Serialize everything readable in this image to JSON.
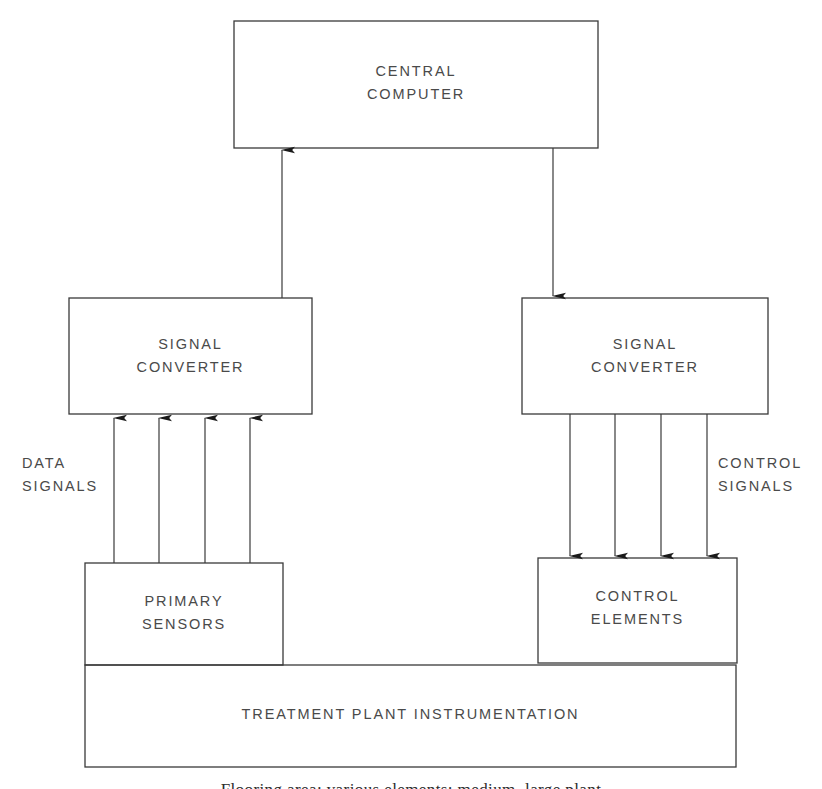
{
  "figure": {
    "type": "block-diagram",
    "background_color": "#ffffff",
    "line_color": "#333333",
    "text_color": "#4a4a4a"
  },
  "boxes": {
    "central_computer": {
      "label": "CENTRAL\nCOMPUTER",
      "x": 234,
      "y": 21,
      "width": 364,
      "height": 127
    },
    "signal_converter_left": {
      "label": "SIGNAL\nCONVERTER",
      "x": 69,
      "y": 298,
      "width": 243,
      "height": 116
    },
    "signal_converter_right": {
      "label": "SIGNAL\nCONVERTER",
      "x": 522,
      "y": 298,
      "width": 246,
      "height": 116
    },
    "primary_sensors": {
      "label": "PRIMARY\nSENSORS",
      "x": 85,
      "y": 563,
      "width": 198,
      "height": 102
    },
    "control_elements": {
      "label": "CONTROL\nELEMENTS",
      "x": 538,
      "y": 558,
      "width": 199,
      "height": 105
    },
    "treatment_plant": {
      "label": "TREATMENT PLANT INSTRUMENTATION",
      "x": 85,
      "y": 665,
      "width": 651,
      "height": 102
    }
  },
  "labels": {
    "data_signals": "DATA\nSIGNALS",
    "control_signals": "CONTROL\nSIGNALS"
  },
  "connectors": {
    "sensors_to_converter": {
      "name": "data-signal-arrows",
      "direction": "up",
      "count": 4,
      "x_positions": [
        114,
        159,
        205,
        250
      ],
      "y_start": 563,
      "y_end": 418
    },
    "converter_to_computer": {
      "name": "data-uplink-arrow",
      "direction": "up",
      "x": 282,
      "y_start": 298,
      "y_end": 150
    },
    "computer_to_converter": {
      "name": "control-downlink-arrow",
      "direction": "down",
      "x": 553,
      "y_start": 148,
      "y_end": 296
    },
    "converter_to_elements": {
      "name": "control-signal-arrows",
      "direction": "down",
      "count": 4,
      "x_positions": [
        570,
        615,
        661,
        707
      ],
      "y_start": 414,
      "y_end": 556
    }
  },
  "caption": {
    "text": "Flooring area; various elements; medium, large plant",
    "visible": "partially-cropped",
    "y": 780
  }
}
